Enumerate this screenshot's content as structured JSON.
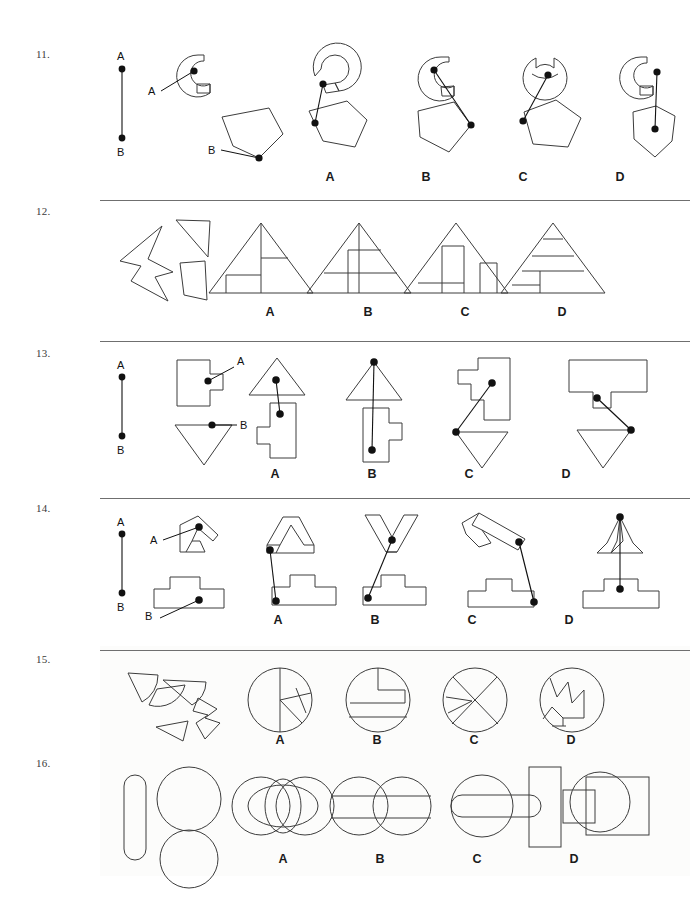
{
  "document": {
    "type": "spatial-reasoning-worksheet",
    "question_numbers": [
      "11.",
      "12.",
      "13.",
      "14.",
      "15.",
      "16."
    ],
    "option_letters": [
      "A",
      "B",
      "C",
      "D"
    ],
    "point_labels": [
      "A",
      "B"
    ]
  },
  "questions": [
    {
      "number": "11.",
      "kind": "connect-points",
      "prompt_labels": [
        "A",
        "B"
      ],
      "stem_labels": [
        "A",
        "B"
      ],
      "options": [
        "A",
        "B",
        "C",
        "D"
      ]
    },
    {
      "number": "12.",
      "kind": "assemble-pieces",
      "prompt_labels": [],
      "stem_labels": [],
      "options": [
        "A",
        "B",
        "C",
        "D"
      ]
    },
    {
      "number": "13.",
      "kind": "connect-points",
      "prompt_labels": [
        "A",
        "B"
      ],
      "stem_labels": [
        "A",
        "B"
      ],
      "options": [
        "A",
        "B",
        "C",
        "D"
      ]
    },
    {
      "number": "14.",
      "kind": "connect-points",
      "prompt_labels": [
        "A",
        "B"
      ],
      "stem_labels": [
        "A",
        "B"
      ],
      "options": [
        "A",
        "B",
        "C",
        "D"
      ]
    },
    {
      "number": "15.",
      "kind": "assemble-pieces",
      "prompt_labels": [],
      "stem_labels": [],
      "options": [
        "A",
        "B",
        "C",
        "D"
      ]
    },
    {
      "number": "16.",
      "kind": "assemble-pieces",
      "prompt_labels": [],
      "stem_labels": [],
      "options": [
        "A",
        "B",
        "C",
        "D"
      ]
    }
  ],
  "colors": {
    "page_background": "#ffffff",
    "panel_background": "#fcfcfb",
    "stroke": "#3c3c3c",
    "ink": "#111111",
    "rule": "#6f6f6f",
    "number_text": "#3a3a3a"
  }
}
